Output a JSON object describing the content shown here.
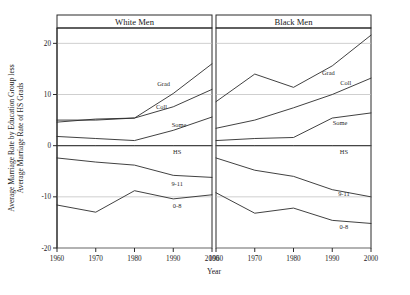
{
  "chart_data": {
    "type": "line",
    "title": "",
    "xlabel": "Year",
    "ylabel_line1": "Average Marriage Rate by Education Group less",
    "ylabel_line2": "Average Marriage Rate of HS Grads",
    "x": [
      1960,
      1970,
      1980,
      1990,
      2000
    ],
    "xticklabels": [
      "1960",
      "1970",
      "1980",
      "1990",
      "2000"
    ],
    "yticklabels": [
      "20",
      "10",
      "0",
      "-10",
      "-20"
    ],
    "ytickvalues": [
      20,
      10,
      0,
      -10,
      -20
    ],
    "xlim": [
      1960,
      2000
    ],
    "ylim": [
      -20,
      23
    ],
    "grid": "horizontal",
    "legend": "inline-labels",
    "panels": [
      {
        "name": "white-men",
        "title": "White Men",
        "series": [
          {
            "name": "Grad",
            "label": "Grad",
            "values": [
              4.6,
              5.2,
              5.4,
              10.2,
              16.0
            ]
          },
          {
            "name": "Coll",
            "label": "Coll",
            "values": [
              5.0,
              5.0,
              5.4,
              7.6,
              11.0
            ]
          },
          {
            "name": "Some",
            "label": "Some",
            "values": [
              1.8,
              1.4,
              1.0,
              3.0,
              5.6
            ]
          },
          {
            "name": "HS",
            "label": "HS",
            "values": [
              0.0,
              0.0,
              0.0,
              0.0,
              0.0
            ]
          },
          {
            "name": "9-11",
            "label": "9-11",
            "values": [
              -2.4,
              -3.2,
              -3.8,
              -5.8,
              -6.2
            ]
          },
          {
            "name": "0-8",
            "label": "0-8",
            "values": [
              -11.6,
              -13.0,
              -8.8,
              -10.4,
              -9.6
            ]
          }
        ]
      },
      {
        "name": "black-men",
        "title": "Black Men",
        "series": [
          {
            "name": "Grad",
            "label": "Grad",
            "values": [
              8.6,
              14.0,
              11.4,
              15.6,
              21.6
            ]
          },
          {
            "name": "Coll",
            "label": "Coll",
            "values": [
              3.4,
              5.0,
              7.4,
              10.0,
              13.2
            ]
          },
          {
            "name": "Some",
            "label": "Some",
            "values": [
              1.0,
              1.4,
              1.6,
              5.4,
              6.4
            ]
          },
          {
            "name": "HS",
            "label": "HS",
            "values": [
              0.0,
              0.0,
              0.0,
              0.0,
              0.0
            ]
          },
          {
            "name": "9-11",
            "label": "9-11",
            "values": [
              -2.4,
              -4.8,
              -6.0,
              -8.6,
              -10.0
            ]
          },
          {
            "name": "0-8",
            "label": "0-8",
            "values": [
              -9.2,
              -13.2,
              -12.2,
              -14.6,
              -15.2
            ]
          }
        ]
      }
    ],
    "colors": {
      "line": "#2b2b2b",
      "grid": "#cfcfcf",
      "zero": "#9a9a9a",
      "axis": "#2a2a2a",
      "background": "#ffffff"
    }
  }
}
